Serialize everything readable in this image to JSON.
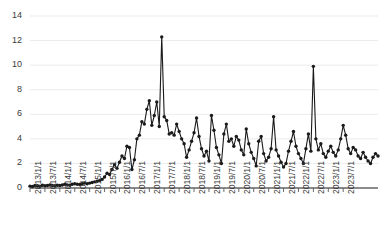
{
  "chart_data": {
    "type": "line",
    "title": "",
    "xlabel": "",
    "ylabel": "",
    "ylim": [
      0,
      14
    ],
    "yticks": [
      0,
      2,
      4,
      6,
      8,
      10,
      12,
      14
    ],
    "grid": true,
    "legend": null,
    "marker": "circle",
    "line_color": "#1a1a1a",
    "grid_color": "#e6e6e6",
    "axis_color": "#595959",
    "xticklabels": [
      "2013/1/1",
      "2013/7/1",
      "2014/1/1",
      "2014/7/1",
      "2015/1/1",
      "2015/7/1",
      "2016/1/1",
      "2016/7/1",
      "2017/1/1",
      "2017/7/1",
      "2018/1/1",
      "2018/7/1",
      "2019/1/1",
      "2019/7/1",
      "2020/1/1",
      "2020/7/1",
      "2021/1/1",
      "2021/7/1",
      "2022/1/1",
      "2022/7/1",
      "2023/1/1",
      "2023/7/1"
    ],
    "x_start": "2013/1/1",
    "x_end": "2023/12/1",
    "x_interval": "monthly",
    "series": [
      {
        "name": "value",
        "values": [
          0.15,
          0.12,
          0.2,
          0.18,
          0.15,
          0.22,
          0.18,
          0.2,
          0.25,
          0.2,
          0.18,
          0.22,
          0.2,
          0.25,
          0.3,
          0.25,
          0.22,
          0.3,
          0.35,
          0.3,
          0.28,
          0.35,
          0.4,
          0.35,
          0.4,
          0.45,
          0.5,
          0.55,
          0.6,
          0.7,
          0.9,
          1.2,
          1.1,
          1.5,
          1.9,
          1.6,
          2.1,
          2.6,
          2.4,
          3.4,
          3.3,
          1.5,
          2.3,
          4.0,
          4.3,
          5.4,
          5.2,
          6.4,
          7.1,
          5.1,
          5.9,
          7.0,
          5.0,
          12.3,
          5.8,
          5.5,
          4.4,
          4.5,
          4.3,
          5.2,
          4.6,
          4.0,
          3.6,
          2.5,
          3.1,
          3.8,
          4.5,
          5.7,
          4.2,
          3.2,
          2.6,
          3.0,
          2.2,
          5.9,
          4.7,
          3.3,
          2.7,
          2.0,
          4.4,
          5.2,
          3.8,
          4.0,
          3.4,
          4.2,
          3.9,
          3.1,
          2.7,
          4.8,
          3.6,
          2.9,
          2.4,
          1.8,
          3.8,
          4.2,
          2.8,
          2.2,
          2.5,
          3.2,
          5.8,
          3.1,
          2.6,
          2.1,
          1.7,
          2.0,
          3.0,
          3.8,
          4.6,
          3.4,
          2.8,
          2.4,
          2.0,
          3.2,
          4.4,
          3.0,
          9.9,
          4.0,
          3.1,
          3.6,
          2.8,
          2.5,
          3.0,
          3.4,
          2.9,
          2.6,
          3.1,
          4.0,
          5.1,
          4.3,
          3.2,
          2.8,
          3.3,
          3.1,
          2.6,
          2.4,
          2.9,
          2.5,
          2.2,
          2.0,
          2.5,
          2.8,
          2.6
        ]
      }
    ]
  }
}
